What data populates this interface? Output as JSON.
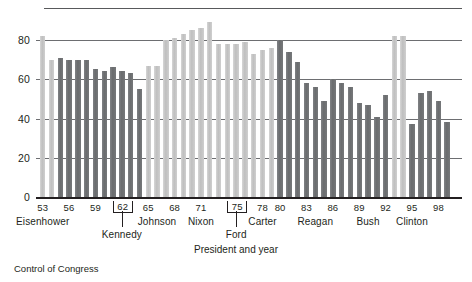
{
  "caption": "Control of Congress",
  "axis_title": "President and year",
  "chart_data": {
    "type": "bar",
    "title": "",
    "subtitle": "",
    "xlabel": "President and year",
    "ylabel": "",
    "ylim": [
      0,
      90
    ],
    "yticks": [
      0,
      20,
      40,
      60,
      80
    ],
    "grid": true,
    "legend": "none",
    "legend_entries": [
      {
        "name": "Democratic control",
        "color": "#c8c8c8"
      },
      {
        "name": "Republican control",
        "color": "#76787a"
      }
    ],
    "colors": {
      "democratic": "#c8c8c8",
      "republican": "#76787a",
      "axis": "#231f20",
      "grid": "#6d6e71",
      "background": "#ffffff"
    },
    "xticks": [
      "53",
      "56",
      "59",
      "62",
      "65",
      "68",
      "71",
      "75",
      "78",
      "80",
      "83",
      "86",
      "89",
      "92",
      "95",
      "98"
    ],
    "boxed_xticks": [
      "62",
      "75"
    ],
    "presidents": [
      {
        "name": "Eisenhower",
        "x_center": 53
      },
      {
        "name": "Kennedy",
        "x_center": 62,
        "offset_row": 1
      },
      {
        "name": "Johnson",
        "x_center": 66
      },
      {
        "name": "Nixon",
        "x_center": 71
      },
      {
        "name": "Ford",
        "x_center": 75,
        "offset_row": 1
      },
      {
        "name": "Carter",
        "x_center": 78
      },
      {
        "name": "Reagan",
        "x_center": 84
      },
      {
        "name": "Bush",
        "x_center": 90
      },
      {
        "name": "Clinton",
        "x_center": 95
      }
    ],
    "categories": [
      "53",
      "54",
      "55",
      "56",
      "57",
      "58",
      "59",
      "60",
      "61",
      "62",
      "63",
      "64",
      "65",
      "66",
      "67",
      "68",
      "69",
      "70",
      "71",
      "72",
      "73",
      "74",
      "75",
      "76",
      "77",
      "78",
      "79",
      "80",
      "81",
      "82",
      "83",
      "84",
      "85",
      "86",
      "87",
      "88",
      "89",
      "90",
      "91",
      "92",
      "93",
      "94",
      "95",
      "96",
      "97",
      "98",
      "99"
    ],
    "series": [
      {
        "name": "Control of Congress",
        "values": [
          82,
          70,
          71,
          70,
          70,
          70,
          65,
          64,
          66,
          64,
          63,
          55,
          67,
          67,
          80,
          81,
          83,
          85,
          86,
          89,
          78,
          78,
          78,
          79,
          73,
          75,
          76,
          80,
          74,
          69,
          58,
          56,
          49,
          60,
          58,
          56,
          48,
          47,
          41,
          52,
          82,
          82,
          37,
          53,
          54,
          49,
          38
        ],
        "party": [
          "dem",
          "dem",
          "rep",
          "rep",
          "rep",
          "rep",
          "rep",
          "rep",
          "rep",
          "rep",
          "rep",
          "rep",
          "dem",
          "dem",
          "dem",
          "dem",
          "dem",
          "dem",
          "dem",
          "dem",
          "dem",
          "dem",
          "dem",
          "dem",
          "dem",
          "dem",
          "dem",
          "rep",
          "rep",
          "rep",
          "rep",
          "rep",
          "rep",
          "rep",
          "rep",
          "rep",
          "rep",
          "rep",
          "rep",
          "rep",
          "dem",
          "dem",
          "rep",
          "rep",
          "rep",
          "rep",
          "rep"
        ]
      }
    ]
  }
}
